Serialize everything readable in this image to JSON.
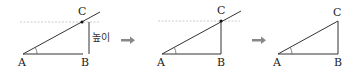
{
  "panels": [
    {
      "id": "panel-1",
      "vertices": {
        "A": "A",
        "B": "B",
        "C": "C"
      },
      "height_label": "높이",
      "has_extended_line": true,
      "has_dotted_guide": true,
      "has_height_line": true
    },
    {
      "id": "panel-2",
      "vertices": {
        "A": "A",
        "B": "B",
        "C": "C"
      },
      "has_extended_line": true,
      "has_dotted_guide": true
    },
    {
      "id": "panel-3",
      "vertices": {
        "A": "A",
        "B": "B",
        "C": "C"
      },
      "has_extended_line": false
    }
  ],
  "arrows": [
    "right-arrow",
    "right-arrow"
  ],
  "colors": {
    "line": "#333333",
    "arrow": "#888888",
    "dotted": "#cccccc"
  }
}
